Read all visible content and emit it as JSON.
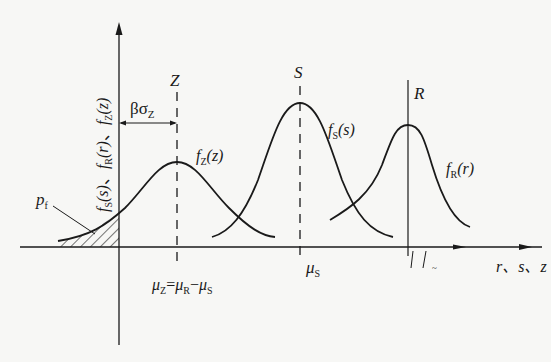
{
  "figure": {
    "type": "stress-strength interference diagram",
    "y_axis_label": {
      "f_s": "f",
      "f_s_sub": "S",
      "f_s_arg": "(s)",
      "sep1": "、",
      "f_r": "f",
      "f_r_sub": "R",
      "f_r_arg": "(r)",
      "sep2": "、",
      "f_z": "f",
      "f_z_sub": "Z",
      "f_z_arg": "(z)"
    },
    "x_axis_label": "r、s、z",
    "curves": [
      {
        "name": "f_Z(z)",
        "label_f": "f",
        "label_sub": "Z",
        "label_arg": "(z)",
        "center_label": "Z",
        "mean_label": "μ",
        "mean_sub": "Z"
      },
      {
        "name": "f_S(s)",
        "label_f": "f",
        "label_sub": "S",
        "label_arg": "(s)",
        "center_label": "S",
        "mean_label": "μ",
        "mean_sub": "S"
      },
      {
        "name": "f_R(r)",
        "label_f": "f",
        "label_sub": "R",
        "label_arg": "(r)",
        "center_label": "R"
      }
    ],
    "annotations": {
      "beta_sigma": "βσ",
      "beta_sigma_sub": "Z",
      "failure_prob": "p",
      "failure_prob_sub": "f",
      "mu_equation": {
        "mu": "μ",
        "z": "Z",
        "eq": "=",
        "r": "R",
        "minus": "−",
        "s": "S"
      },
      "break_mark": "~"
    },
    "colors": {
      "line": "#1a1a1a",
      "background": "#f7f7f5"
    }
  }
}
